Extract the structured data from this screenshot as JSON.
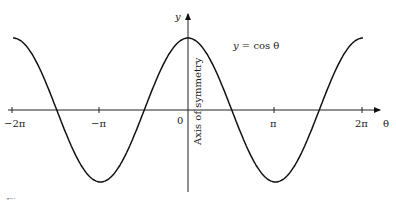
{
  "chart_data": {
    "type": "line",
    "title": "",
    "function_label": "y = cos θ",
    "xlabel": "θ",
    "ylabel": "y",
    "axis_annotation": "Axis of symmetry",
    "x_tick_labels": [
      "−2π",
      "−π",
      "0",
      "π",
      "2π"
    ],
    "x_ticks": [
      -6.2832,
      -3.1416,
      0,
      3.1416,
      6.2832
    ],
    "xlim": [
      -6.6,
      7.0
    ],
    "ylim": [
      -1.2,
      1.5
    ],
    "grid": false,
    "legend": null,
    "series": [
      {
        "name": "y = cos θ",
        "x": [
          -6.2832,
          -4.7124,
          -3.1416,
          -1.5708,
          0,
          1.5708,
          3.1416,
          4.7124,
          6.2832
        ],
        "values": [
          1,
          0,
          -1,
          0,
          1,
          0,
          -1,
          0,
          1
        ]
      }
    ]
  },
  "caption": "Figure"
}
